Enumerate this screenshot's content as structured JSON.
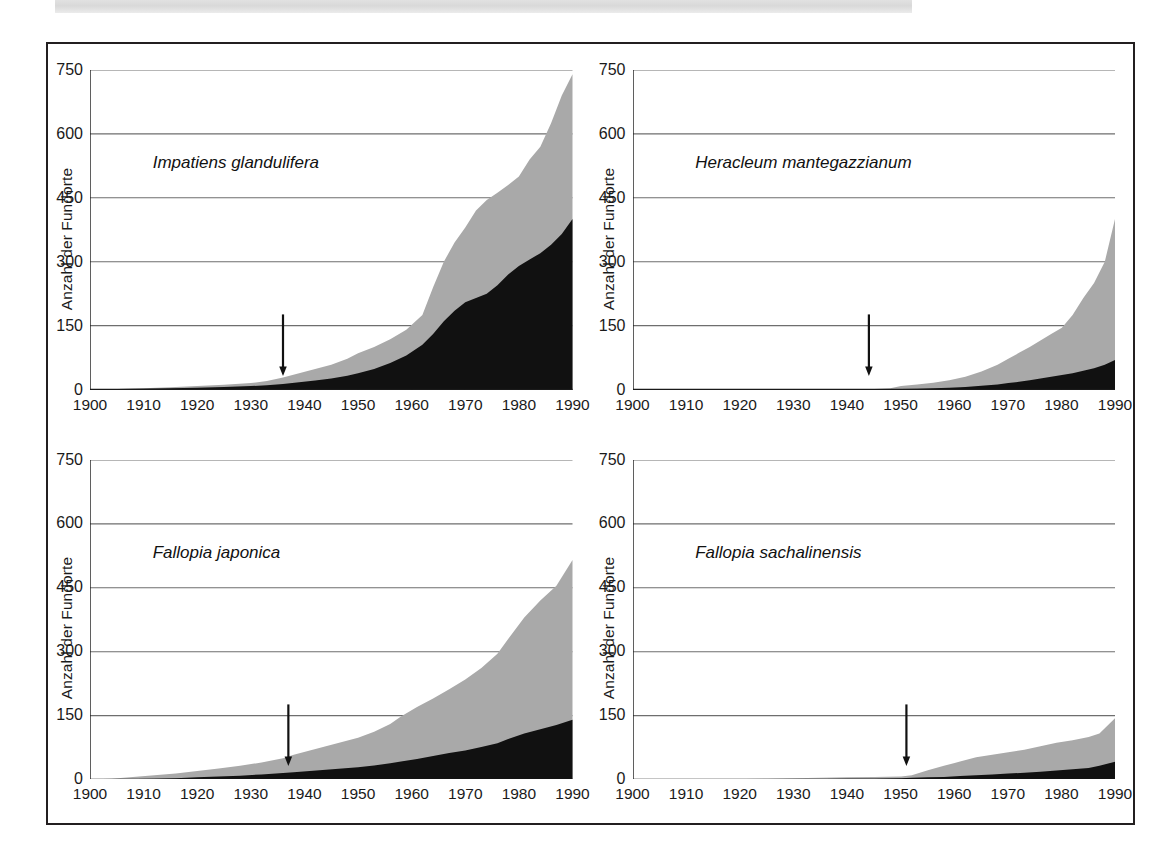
{
  "figure": {
    "axis_title_y": "Anzahl der Fundorte",
    "y_ticks": [
      "0",
      "150",
      "300",
      "450",
      "600",
      "750"
    ],
    "x_ticks": [
      "1900",
      "1910",
      "1920",
      "1930",
      "1940",
      "1950",
      "1960",
      "1970",
      "1980",
      "1990"
    ],
    "colors": {
      "series_lower": "#111111",
      "series_upper": "#a9a9a9",
      "gridline": "#6e6e6e",
      "axis": "#1a1a1a",
      "frame": "#231f20",
      "scan_band": "#dcdcdc"
    },
    "panels": [
      {
        "species": "Impatiens glandulifera"
      },
      {
        "species": "Heracleum mantegazzianum"
      },
      {
        "species": "Fallopia japonica"
      },
      {
        "species": "Fallopia sachalinensis"
      }
    ]
  },
  "chart_data": [
    {
      "type": "area",
      "title": "Impatiens glandulifera",
      "xlabel": "",
      "ylabel": "Anzahl der Fundorte",
      "xlim": [
        1900,
        1990
      ],
      "ylim": [
        0,
        750
      ],
      "yticks": [
        0,
        150,
        300,
        450,
        600,
        750
      ],
      "xticks": [
        1900,
        1910,
        1920,
        1930,
        1940,
        1950,
        1960,
        1970,
        1980,
        1990
      ],
      "grid": "horizontal",
      "stacked": true,
      "annotation": {
        "type": "arrow",
        "x": 1936,
        "label": ""
      },
      "x": [
        1900,
        1905,
        1910,
        1915,
        1920,
        1925,
        1930,
        1933,
        1936,
        1939,
        1942,
        1945,
        1948,
        1950,
        1953,
        1956,
        1959,
        1962,
        1964,
        1966,
        1968,
        1970,
        1972,
        1974,
        1976,
        1978,
        1980,
        1982,
        1984,
        1986,
        1988,
        1990
      ],
      "series": [
        {
          "name": "lower-black",
          "values": [
            0,
            1,
            2,
            3,
            4,
            6,
            8,
            10,
            13,
            17,
            21,
            26,
            32,
            38,
            48,
            62,
            80,
            105,
            130,
            160,
            185,
            205,
            215,
            225,
            245,
            270,
            290,
            305,
            320,
            340,
            365,
            400
          ]
        },
        {
          "name": "upper-gray-total",
          "values": [
            0,
            1,
            3,
            5,
            8,
            11,
            15,
            20,
            28,
            38,
            48,
            58,
            72,
            85,
            100,
            118,
            140,
            175,
            240,
            300,
            345,
            380,
            420,
            445,
            462,
            480,
            500,
            540,
            570,
            625,
            690,
            740
          ]
        }
      ]
    },
    {
      "type": "area",
      "title": "Heracleum mantegazzianum",
      "xlabel": "",
      "ylabel": "Anzahl der Fundorte",
      "xlim": [
        1900,
        1990
      ],
      "ylim": [
        0,
        750
      ],
      "yticks": [
        0,
        150,
        300,
        450,
        600,
        750
      ],
      "xticks": [
        1900,
        1910,
        1920,
        1930,
        1940,
        1950,
        1960,
        1970,
        1980,
        1990
      ],
      "grid": "horizontal",
      "stacked": true,
      "annotation": {
        "type": "arrow",
        "x": 1944,
        "label": ""
      },
      "x": [
        1900,
        1910,
        1920,
        1930,
        1940,
        1945,
        1948,
        1950,
        1953,
        1956,
        1959,
        1962,
        1965,
        1968,
        1970,
        1972,
        1974,
        1976,
        1978,
        1980,
        1982,
        1984,
        1986,
        1988,
        1990
      ],
      "series": [
        {
          "name": "lower-black",
          "values": [
            0,
            0,
            0,
            0,
            0,
            0,
            0,
            1,
            2,
            3,
            4,
            6,
            9,
            12,
            15,
            18,
            22,
            26,
            30,
            34,
            38,
            44,
            50,
            58,
            70
          ]
        },
        {
          "name": "upper-gray-total",
          "values": [
            0,
            0,
            0,
            0,
            0,
            1,
            3,
            8,
            12,
            16,
            22,
            30,
            42,
            58,
            72,
            86,
            100,
            115,
            130,
            145,
            175,
            215,
            250,
            300,
            405
          ]
        }
      ]
    },
    {
      "type": "area",
      "title": "Fallopia japonica",
      "xlabel": "",
      "ylabel": "Anzahl der Fundorte",
      "xlim": [
        1900,
        1990
      ],
      "ylim": [
        0,
        750
      ],
      "yticks": [
        0,
        150,
        300,
        450,
        600,
        750
      ],
      "xticks": [
        1900,
        1910,
        1920,
        1930,
        1940,
        1950,
        1960,
        1970,
        1980,
        1990
      ],
      "grid": "horizontal",
      "stacked": true,
      "annotation": {
        "type": "arrow",
        "x": 1937,
        "label": ""
      },
      "x": [
        1900,
        1904,
        1908,
        1912,
        1916,
        1920,
        1924,
        1928,
        1932,
        1936,
        1938,
        1941,
        1944,
        1947,
        1950,
        1953,
        1956,
        1958,
        1961,
        1964,
        1967,
        1970,
        1973,
        1976,
        1978,
        1981,
        1984,
        1987,
        1990
      ],
      "series": [
        {
          "name": "lower-black",
          "values": [
            0,
            0,
            1,
            2,
            3,
            5,
            7,
            9,
            12,
            15,
            17,
            20,
            23,
            26,
            29,
            33,
            38,
            42,
            48,
            55,
            62,
            68,
            76,
            85,
            95,
            108,
            118,
            128,
            140
          ]
        },
        {
          "name": "upper-gray-total",
          "values": [
            0,
            2,
            6,
            10,
            14,
            20,
            26,
            32,
            40,
            50,
            58,
            68,
            78,
            88,
            98,
            112,
            130,
            148,
            170,
            190,
            212,
            235,
            262,
            295,
            330,
            380,
            420,
            455,
            515
          ]
        }
      ]
    },
    {
      "type": "area",
      "title": "Fallopia sachalinensis",
      "xlabel": "",
      "ylabel": "Anzahl der Fundorte",
      "xlim": [
        1900,
        1990
      ],
      "ylim": [
        0,
        750
      ],
      "yticks": [
        0,
        150,
        300,
        450,
        600,
        750
      ],
      "xticks": [
        1900,
        1910,
        1920,
        1930,
        1940,
        1950,
        1960,
        1970,
        1980,
        1990
      ],
      "grid": "horizontal",
      "stacked": true,
      "annotation": {
        "type": "arrow",
        "x": 1951,
        "label": ""
      },
      "x": [
        1900,
        1910,
        1920,
        1925,
        1930,
        1935,
        1940,
        1945,
        1950,
        1952,
        1955,
        1958,
        1961,
        1964,
        1967,
        1970,
        1973,
        1976,
        1979,
        1982,
        1985,
        1987,
        1990
      ],
      "series": [
        {
          "name": "lower-black",
          "values": [
            0,
            0,
            0,
            0,
            1,
            1,
            2,
            2,
            3,
            4,
            5,
            6,
            8,
            10,
            12,
            14,
            16,
            18,
            21,
            24,
            27,
            32,
            42
          ]
        },
        {
          "name": "upper-gray-total",
          "values": [
            0,
            0,
            1,
            2,
            3,
            4,
            5,
            6,
            7,
            10,
            22,
            32,
            42,
            52,
            58,
            64,
            70,
            78,
            86,
            92,
            100,
            108,
            145
          ]
        }
      ]
    }
  ]
}
